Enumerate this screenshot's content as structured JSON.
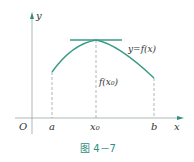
{
  "figure": {
    "caption": "图 4－7",
    "curve_label": "y=f(x)",
    "value_label": "f(x₀)",
    "axis_labels": {
      "x": "x",
      "y": "y",
      "origin": "O"
    },
    "tick_labels": {
      "a": "a",
      "x0": "x₀",
      "b": "b"
    },
    "colors": {
      "curve": "#3a9a86",
      "tangent": "#3a9a86",
      "axis": "#9aa6a4",
      "arrow": "#2f8f7f",
      "dashed": "#9aa6a4",
      "text": "#333333",
      "caption": "#2f8f7f"
    }
  }
}
